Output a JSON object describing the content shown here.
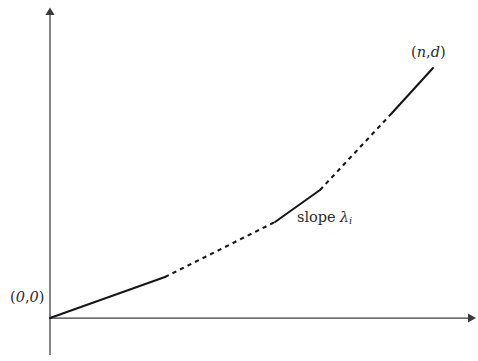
{
  "figure": {
    "background_color": "#ffffff",
    "ink_color": "#17171a",
    "axis_color": "#3b3b3f",
    "labels": {
      "origin": {
        "open_paren": "(",
        "x_value": "0",
        "comma": ",",
        "y_value": "0",
        "close_paren": ")",
        "full_text": "(0, 0)"
      },
      "endpoint": {
        "open_paren": "(",
        "x_symbol": "n",
        "comma": ",",
        "y_symbol": "d",
        "close_paren": ")",
        "full_text": "(n, d)"
      },
      "slope": {
        "word": "slope",
        "symbol": "λ",
        "subscript": "i",
        "full_text": "slope λᵢ"
      }
    },
    "axes": {
      "x_axis_name": "horizontal axis",
      "y_axis_name": "vertical axis",
      "x_has_arrow": "true",
      "y_has_arrow": "true"
    }
  },
  "chart_data": {
    "type": "line",
    "xlabel": "",
    "ylabel": "",
    "grid": "off",
    "legend": "none",
    "axis_origin_px": [
      50,
      318
    ],
    "xlim_px": [
      50,
      470
    ],
    "ylim_px": [
      318,
      12
    ],
    "annotations": [
      {
        "text": "(0, 0)",
        "target_px": [
          50,
          318
        ],
        "label_px": [
          10,
          290
        ]
      },
      {
        "text": "(n, d)",
        "target_px": [
          433,
          68
        ],
        "label_px": [
          411,
          45
        ]
      },
      {
        "text": "slope λᵢ",
        "target_px": [
          298,
          206
        ],
        "label_px": [
          297,
          210
        ]
      }
    ],
    "series": [
      {
        "name": "convex piecewise path",
        "style": "alternating solid and dashed",
        "points_px": [
          [
            50,
            318
          ],
          [
            165,
            277
          ],
          [
            275,
            222
          ],
          [
            320,
            190
          ],
          [
            392,
            113
          ],
          [
            433,
            68
          ]
        ],
        "segments": [
          {
            "index": 0,
            "style": "solid",
            "from_px": [
              50,
              318
            ],
            "to_px": [
              165,
              277
            ]
          },
          {
            "index": 1,
            "style": "dashed",
            "from_px": [
              165,
              277
            ],
            "to_px": [
              275,
              222
            ]
          },
          {
            "index": 2,
            "style": "solid",
            "from_px": [
              275,
              222
            ],
            "to_px": [
              320,
              190
            ]
          },
          {
            "index": 3,
            "style": "dashed",
            "from_px": [
              320,
              190
            ],
            "to_px": [
              392,
              113
            ]
          },
          {
            "index": 4,
            "style": "solid",
            "from_px": [
              392,
              113
            ],
            "to_px": [
              433,
              68
            ]
          }
        ]
      }
    ]
  }
}
